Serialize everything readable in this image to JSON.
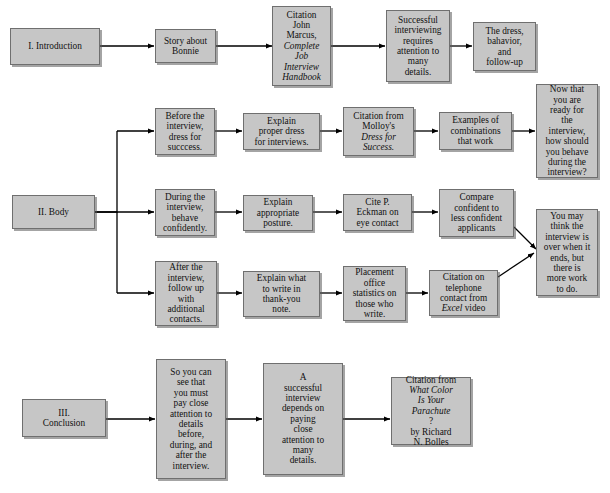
{
  "diagram": {
    "style": {
      "node_fill": "#c6c6c6",
      "node_border": "#6f6f6f",
      "arrow_color": "#000000",
      "background": "#ffffff"
    },
    "sections": [
      {
        "id": "introduction",
        "label": "I. Introduction"
      },
      {
        "id": "body",
        "label": "II. Body"
      },
      {
        "id": "conclusion",
        "label": "III.\nConclusion"
      }
    ],
    "nodes": [
      {
        "id": "intro",
        "text": "I. Introduction"
      },
      {
        "id": "intro-1",
        "text": "Story about\nBonnie"
      },
      {
        "id": "intro-2-line1",
        "text": "Citation\nJohn\nMarcus,"
      },
      {
        "id": "intro-2-line2",
        "text": "Complete\nJob\nInterview\nHandbook"
      },
      {
        "id": "intro-3",
        "text": "Successful\ninterviewing\nrequires\nattention to\nmany\ndetails."
      },
      {
        "id": "intro-4",
        "text": "The dress,\nbahavior,\nand\nfollow-up"
      },
      {
        "id": "body",
        "text": "II. Body"
      },
      {
        "id": "body-r1-1",
        "text": "Before the\ninterview,\ndress for\nsucccess."
      },
      {
        "id": "body-r1-2",
        "text": "Explain\nproper dress\nfor interviews."
      },
      {
        "id": "body-r1-3a",
        "text": "Citation from\nMolloy's"
      },
      {
        "id": "body-r1-3b",
        "text": "Dress for\nSuccess."
      },
      {
        "id": "body-r1-4",
        "text": "Examples of\ncombinations\nthat work"
      },
      {
        "id": "body-r2-1",
        "text": "During the\ninterview,\nbehave\nconfidently."
      },
      {
        "id": "body-r2-2",
        "text": "Explain\nappropriate\nposture."
      },
      {
        "id": "body-r2-3",
        "text": "Cite P.\nEckman on\neye contact"
      },
      {
        "id": "body-r2-4",
        "text": "Compare\nconfident to\nless confident\napplicants"
      },
      {
        "id": "body-r3-1",
        "text": "After the\ninterview,\nfollow up\nwith\nadditional\ncontacts."
      },
      {
        "id": "body-r3-2",
        "text": "Explain what\nto write in\nthank-you\nnote."
      },
      {
        "id": "body-r3-3",
        "text": "Placement\noffice\nstatistics on\nthose who\nwrite."
      },
      {
        "id": "body-r3-4a",
        "text": "Citation on\ntelephone\ncontact from"
      },
      {
        "id": "body-r3-4b",
        "text": "Excel"
      },
      {
        "id": "body-r3-4c",
        "text": " video"
      },
      {
        "id": "transition-1",
        "text": "Now that\nyou are\nready for\nthe\ninterview,\nhow should\nyou behave\nduring the\ninterview?"
      },
      {
        "id": "transition-2",
        "text": "You may\nthink the\ninterview is\nover when it\nends, but\nthere is\nmore work\nto do."
      },
      {
        "id": "concl",
        "text": "III.\nConclusion"
      },
      {
        "id": "concl-1",
        "text": "So you can\nsee that\nyou must\npay close\nattention to\ndetails\nbefore,\nduring, and\nafter the\ninterview."
      },
      {
        "id": "concl-2",
        "text": "A\nsuccessful\ninterview\ndepends on\npaying\nclose\nattention to\nmany\ndetails."
      },
      {
        "id": "concl-3a",
        "text": "Citation from"
      },
      {
        "id": "concl-3b",
        "text": "What Color\nIs Your\nParachute"
      },
      {
        "id": "concl-3c",
        "text": "?\nby Richard\nN. Bolles"
      }
    ]
  }
}
